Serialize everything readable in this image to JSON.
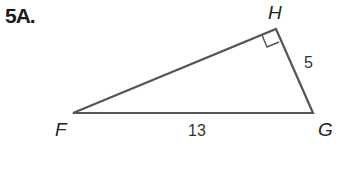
{
  "problem": {
    "label": "5A."
  },
  "triangle": {
    "vertices": [
      {
        "name": "F",
        "x": 73,
        "y": 113
      },
      {
        "name": "G",
        "x": 313,
        "y": 113
      },
      {
        "name": "H",
        "x": 276,
        "y": 29
      }
    ],
    "right_angle_at": "H",
    "sides": [
      {
        "between": "H-G",
        "label": "5"
      },
      {
        "between": "F-G",
        "label": "13"
      }
    ],
    "stroke_color": "#555555"
  }
}
